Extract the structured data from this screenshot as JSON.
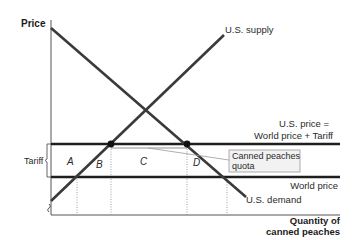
{
  "diagram": {
    "axes": {
      "y_label": "Price",
      "x_label_line1": "Quantity of",
      "x_label_line2": "canned peaches"
    },
    "curves": {
      "supply_label": "U.S. supply",
      "demand_label": "U.S. demand"
    },
    "price_lines": {
      "us_price_line1": "U.S. price =",
      "us_price_line2": "World price + Tariff",
      "world_price": "World price"
    },
    "tariff_label": "Tariff",
    "areas": {
      "a": "A",
      "b": "B",
      "c": "C",
      "d": "D"
    },
    "callout": {
      "line1": "Canned peaches",
      "line2": "quota"
    },
    "colors": {
      "line": "#3a3a3a",
      "axis": "#555555",
      "callout_bg": "#f2f2f2",
      "callout_border": "#9a9a9a"
    }
  }
}
